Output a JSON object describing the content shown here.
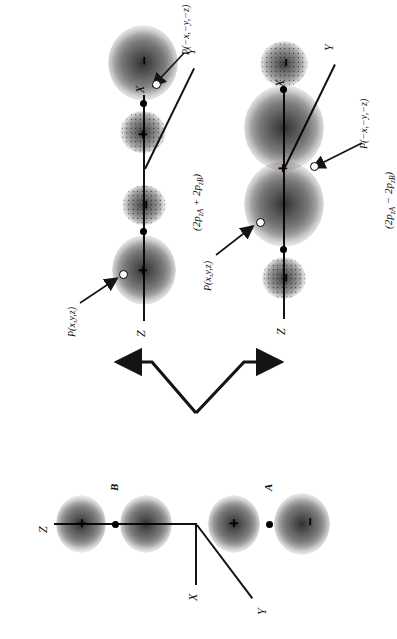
{
  "figure": {
    "type": "molecular-orbital-diagram",
    "orientation_degrees": -90
  },
  "panels": {
    "source": {
      "id": "atomic-orbitals",
      "formula": "",
      "axes": {
        "x": "X",
        "y": "Y",
        "z": "Z"
      },
      "orbital_labels": [
        "A",
        "B"
      ],
      "lobe_signs": [
        "−",
        "+",
        "+",
        "−"
      ]
    },
    "bonding": {
      "id": "bonding-mo",
      "formula_prefix": "(2p",
      "formula_sub_a": "zA",
      "formula_op": " + 2p",
      "formula_sub_b": "zB",
      "formula_suffix": ")",
      "formula_plain": "(2p zA + 2p zB)",
      "axes": {
        "x": "X",
        "y": "Y",
        "z": "Z"
      },
      "point_label_positive": "P(x,y,z)",
      "point_label_negative": "P(−x,−y,−z)",
      "lobe_signs": [
        "−",
        "+",
        "+",
        "−"
      ]
    },
    "antibonding": {
      "id": "antibonding-mo",
      "formula_prefix": "(2p",
      "formula_sub_a": "zA",
      "formula_op": " − 2p",
      "formula_sub_b": "zB",
      "formula_suffix": ")",
      "formula_plain": "(2p zA − 2p zB)",
      "axes": {
        "x": "X",
        "y": "Y",
        "z": "Z"
      },
      "point_label_positive": "P(x,y,z)",
      "point_label_negative": "P(−x,−y,−z)",
      "lobe_signs": [
        "−",
        "+",
        "+",
        "−"
      ]
    }
  },
  "colors": {
    "ink": "#141414",
    "background": "#ffffff"
  }
}
